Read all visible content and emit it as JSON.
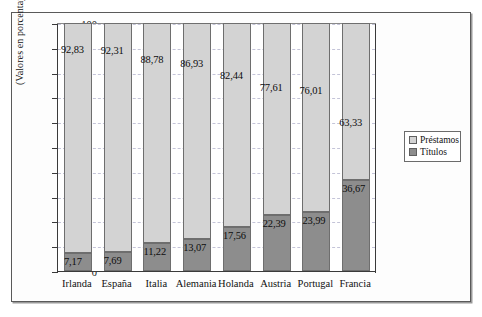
{
  "chart_data": {
    "type": "bar",
    "subtype": "stacked-100-percent",
    "title": "",
    "xlabel": "",
    "ylabel": "(Valores en porcentajes)",
    "ylim": [
      0,
      100
    ],
    "yticks": [
      0,
      10,
      20,
      30,
      40,
      50,
      60,
      70,
      80,
      90,
      100
    ],
    "grid": true,
    "grid_orientation": "horizontal",
    "legend_position": "right",
    "categories": [
      "Irlanda",
      "España",
      "Italia",
      "Alemania",
      "Holanda",
      "Austria",
      "Portugal",
      "Francia"
    ],
    "series": [
      {
        "name": "Préstamos",
        "color": "#d3d3d3",
        "values": [
          92.83,
          92.31,
          88.78,
          86.93,
          82.44,
          77.61,
          76.01,
          63.33
        ],
        "labels": [
          "92,83",
          "92,31",
          "88,78",
          "86,93",
          "82,44",
          "77,61",
          "76,01",
          "63,33"
        ]
      },
      {
        "name": "Títulos",
        "color": "#8d8d8d",
        "values": [
          7.17,
          7.69,
          11.22,
          13.07,
          17.56,
          22.39,
          23.99,
          36.67
        ],
        "labels": [
          "7,17",
          "7,69",
          "11,22",
          "13,07",
          "17,56",
          "22,39",
          "23,99",
          "36,67"
        ]
      }
    ]
  },
  "legend": {
    "items": [
      {
        "label": "Préstamos",
        "swatch": "light"
      },
      {
        "label": "Títulos",
        "swatch": "dark"
      }
    ]
  },
  "axis": {
    "y_caption": "(Valores en porcentajes)",
    "y_tick_labels": [
      "0",
      "10",
      "20",
      "30",
      "40",
      "50",
      "60",
      "70",
      "80",
      "90",
      "100"
    ]
  }
}
